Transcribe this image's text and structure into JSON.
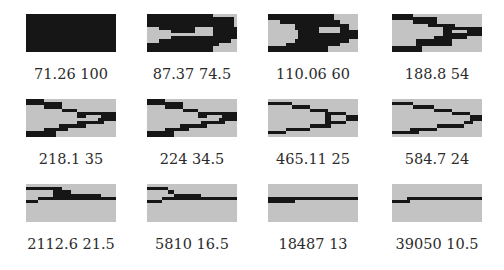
{
  "figure": {
    "grid": {
      "cols": 30,
      "rows": 12
    },
    "colors": {
      "void": "#c3c3c3",
      "material": "#161616"
    },
    "panels": [
      {
        "caption": "71.26 100",
        "rects": [
          [
            0,
            30,
            0,
            12
          ]
        ]
      },
      {
        "caption": "87.37 74.5",
        "rects": [
          [
            0,
            22,
            0,
            2
          ],
          [
            22,
            29,
            1,
            2
          ],
          [
            0,
            11,
            2,
            4
          ],
          [
            11,
            29,
            2,
            4
          ],
          [
            4,
            16,
            4,
            5
          ],
          [
            6,
            16,
            5,
            6
          ],
          [
            16,
            17,
            4,
            5
          ],
          [
            22,
            30,
            4,
            5
          ],
          [
            22,
            30,
            5,
            7
          ],
          [
            22,
            29,
            7,
            8
          ],
          [
            8,
            30,
            7,
            8
          ],
          [
            0,
            30,
            7,
            8
          ],
          [
            0,
            24,
            8,
            10
          ],
          [
            24,
            28,
            8,
            9
          ],
          [
            0,
            22,
            10,
            12
          ]
        ],
        "voids": [
          [
            0,
            4,
            4,
            9
          ],
          [
            4,
            8,
            5,
            8
          ],
          [
            16,
            22,
            4,
            6
          ],
          [
            22,
            26,
            10,
            12
          ],
          [
            24,
            30,
            9,
            12
          ]
        ]
      },
      {
        "caption": "110.06 60",
        "rects": [
          [
            0,
            22,
            0,
            2
          ],
          [
            4,
            24,
            2,
            3
          ],
          [
            9,
            27,
            3,
            5
          ],
          [
            10,
            30,
            5,
            8
          ],
          [
            9,
            27,
            8,
            9
          ],
          [
            6,
            24,
            9,
            10
          ],
          [
            0,
            20,
            10,
            12
          ]
        ],
        "voids": [
          [
            17,
            24,
            4,
            6
          ]
        ]
      },
      {
        "caption": "188.8 54",
        "rects": [
          [
            0,
            7,
            0,
            2
          ],
          [
            7,
            15,
            1,
            3
          ],
          [
            12,
            21,
            3,
            4
          ],
          [
            17,
            30,
            4,
            6
          ],
          [
            17,
            30,
            6,
            7
          ],
          [
            14,
            25,
            7,
            8
          ],
          [
            8,
            20,
            8,
            10
          ],
          [
            0,
            10,
            10,
            12
          ]
        ],
        "voids": [
          [
            20,
            25,
            5,
            6
          ]
        ]
      },
      {
        "caption": "218.1 35",
        "rects": [
          [
            0,
            6,
            0,
            2
          ],
          [
            6,
            12,
            1,
            3
          ],
          [
            12,
            17,
            3,
            4
          ],
          [
            17,
            24,
            4,
            6
          ],
          [
            24,
            30,
            4,
            7
          ],
          [
            17,
            26,
            7,
            8
          ],
          [
            11,
            20,
            8,
            9
          ],
          [
            6,
            14,
            9,
            10
          ],
          [
            0,
            10,
            10,
            12
          ]
        ],
        "voids": [
          [
            20,
            25,
            5,
            6
          ]
        ]
      },
      {
        "caption": "224 34.5",
        "rects": [
          [
            0,
            6,
            0,
            2
          ],
          [
            6,
            12,
            1,
            3
          ],
          [
            12,
            17,
            3,
            4
          ],
          [
            17,
            24,
            4,
            6
          ],
          [
            24,
            30,
            4,
            7
          ],
          [
            18,
            26,
            7,
            8
          ],
          [
            11,
            20,
            8,
            9
          ],
          [
            6,
            14,
            9,
            10
          ],
          [
            0,
            9,
            10,
            12
          ]
        ],
        "voids": [
          [
            20,
            25,
            5,
            6
          ]
        ]
      },
      {
        "caption": "465.11 25",
        "rects": [
          [
            0,
            8,
            1,
            2
          ],
          [
            8,
            14,
            2,
            3
          ],
          [
            14,
            20,
            3,
            4
          ],
          [
            19,
            26,
            4,
            5
          ],
          [
            19,
            21,
            4,
            8
          ],
          [
            26,
            30,
            5,
            7
          ],
          [
            21,
            26,
            7,
            8
          ],
          [
            14,
            21,
            8,
            9
          ],
          [
            6,
            14,
            9,
            10
          ],
          [
            0,
            6,
            10,
            11
          ]
        ],
        "voids": []
      },
      {
        "caption": "584.7 24",
        "rects": [
          [
            0,
            7,
            1,
            2
          ],
          [
            7,
            14,
            2,
            3
          ],
          [
            14,
            20,
            3,
            4
          ],
          [
            20,
            26,
            4,
            5
          ],
          [
            26,
            30,
            5,
            7
          ],
          [
            24,
            27,
            7,
            8
          ],
          [
            15,
            24,
            8,
            9
          ],
          [
            6,
            15,
            9,
            10
          ],
          [
            0,
            9,
            10,
            11
          ]
        ],
        "voids": []
      },
      {
        "caption": "2112.6 21.5",
        "rects": [
          [
            0,
            9,
            1,
            2
          ],
          [
            9,
            12,
            1,
            3
          ],
          [
            12,
            15,
            2,
            3
          ],
          [
            9,
            25,
            3,
            4
          ],
          [
            25,
            30,
            4,
            5
          ],
          [
            4,
            12,
            4,
            5
          ],
          [
            12,
            25,
            4,
            5
          ],
          [
            0,
            4,
            5,
            6
          ]
        ],
        "voids": []
      },
      {
        "caption": "5810 16.5",
        "rects": [
          [
            0,
            7,
            1,
            2
          ],
          [
            7,
            9,
            2,
            3
          ],
          [
            9,
            18,
            3,
            4
          ],
          [
            9,
            30,
            4,
            5
          ],
          [
            5,
            9,
            4,
            5
          ],
          [
            0,
            5,
            5,
            6
          ]
        ],
        "voids": []
      },
      {
        "caption": "18487 13",
        "rects": [
          [
            0,
            9,
            4,
            6
          ],
          [
            9,
            30,
            4,
            5
          ]
        ],
        "voids": []
      },
      {
        "caption": "39050 10.5",
        "rects": [
          [
            0,
            5,
            5,
            6
          ],
          [
            5,
            6,
            4,
            6
          ],
          [
            6,
            30,
            4,
            5
          ]
        ],
        "voids": []
      }
    ]
  }
}
